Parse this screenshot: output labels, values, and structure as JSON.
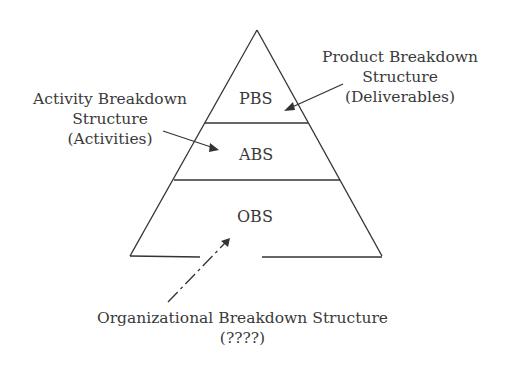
{
  "levels": {
    "pbs": "PBS",
    "abs": "ABS",
    "obs": "OBS"
  },
  "annotations": {
    "product": {
      "line1": "Product Breakdown",
      "line2": "Structure",
      "line3": "(Deliverables)"
    },
    "activity": {
      "line1": "Activity Breakdown",
      "line2": "Structure",
      "line3": "(Activities)"
    },
    "organizational": {
      "line1": "Organizational Breakdown Structure",
      "line2": "(????)"
    }
  },
  "colors": {
    "stroke": "#333333",
    "background": "#ffffff"
  }
}
